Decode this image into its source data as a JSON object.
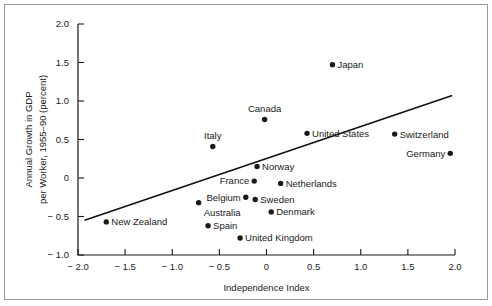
{
  "chart_data": {
    "type": "scatter",
    "title": "",
    "xlabel": "Independence Index",
    "ylabel": "Annual Growth in GDP per Worker, 1955–90 (percent)",
    "ylabel_line1": "Annual Growth in GDP",
    "ylabel_line2": "per Worker, 1955–90 (percent)",
    "xlim": [
      -2.0,
      2.0
    ],
    "ylim": [
      -1.0,
      2.0
    ],
    "xticks": [
      -2.0,
      -1.5,
      -1.0,
      -0.5,
      0,
      0.5,
      1.0,
      1.5,
      2.0
    ],
    "xtick_labels": [
      "− 2.0",
      "− 1.5",
      "− 1.0",
      "− 0.5",
      "0",
      "0.5",
      "1.0",
      "1.5",
      "2.0"
    ],
    "yticks": [
      2.0,
      1.5,
      1.0,
      0.5,
      0,
      -0.5,
      -1.0
    ],
    "ytick_labels": [
      "2.0",
      "1.5",
      "1.0",
      "0.5",
      "0",
      "− 0.5",
      "− 1.0"
    ],
    "grid": false,
    "legend": false,
    "points": [
      {
        "label": "New Zealand",
        "x": -1.7,
        "y": -0.57,
        "label_side": "right"
      },
      {
        "label": "Australia",
        "x": -0.72,
        "y": -0.32,
        "label_side": "below-right"
      },
      {
        "label": "Spain",
        "x": -0.62,
        "y": -0.62,
        "label_side": "right"
      },
      {
        "label": "Italy",
        "x": -0.57,
        "y": 0.41,
        "label_side": "above"
      },
      {
        "label": "United Kingdom",
        "x": -0.28,
        "y": -0.78,
        "label_side": "right"
      },
      {
        "label": "Belgium",
        "x": -0.22,
        "y": -0.25,
        "label_side": "left"
      },
      {
        "label": "France",
        "x": -0.13,
        "y": -0.04,
        "label_side": "left"
      },
      {
        "label": "Sweden",
        "x": -0.12,
        "y": -0.28,
        "label_side": "right"
      },
      {
        "label": "Norway",
        "x": -0.1,
        "y": 0.15,
        "label_side": "right"
      },
      {
        "label": "Canada",
        "x": -0.02,
        "y": 0.76,
        "label_side": "above"
      },
      {
        "label": "Denmark",
        "x": 0.05,
        "y": -0.44,
        "label_side": "right"
      },
      {
        "label": "Netherlands",
        "x": 0.15,
        "y": -0.07,
        "label_side": "right"
      },
      {
        "label": "United States",
        "x": 0.43,
        "y": 0.58,
        "label_side": "right"
      },
      {
        "label": "Japan",
        "x": 0.7,
        "y": 1.47,
        "label_side": "right"
      },
      {
        "label": "Switzerland",
        "x": 1.36,
        "y": 0.57,
        "label_side": "right"
      },
      {
        "label": "Germany",
        "x": 1.95,
        "y": 0.32,
        "label_side": "left"
      }
    ],
    "trendline": {
      "x_start": -1.93,
      "y_start": -0.55,
      "x_end": 1.97,
      "y_end": 1.07
    },
    "colors": {
      "marker": "#1a1a1a",
      "trendline": "#111111",
      "axis": "#1a1a1a",
      "background": "#ffffff",
      "frame": "#9a9a9a"
    }
  }
}
